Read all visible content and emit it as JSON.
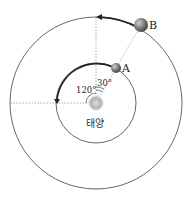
{
  "diagram": {
    "sun_label": "태양",
    "planet_a_label": "A",
    "planet_b_label": "B",
    "angle_120_label": "120°",
    "angle_30_label": "30°",
    "colors": {
      "orbit": "#555555",
      "arrow": "#222222",
      "planet": "#7a7a7a",
      "sun": "#bdbdbd",
      "dashed": "#888888"
    }
  }
}
